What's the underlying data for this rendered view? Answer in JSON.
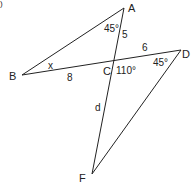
{
  "figure": {
    "corner_mark": ")",
    "points": {
      "A": {
        "label": "A",
        "x": 124,
        "y": 8
      },
      "B": {
        "label": "B",
        "x": 22,
        "y": 75
      },
      "C": {
        "label": "C",
        "x": 115,
        "y": 62
      },
      "D": {
        "label": "D",
        "x": 181,
        "y": 50
      },
      "F": {
        "label": "F",
        "x": 92,
        "y": 174
      }
    },
    "labels": {
      "angle_A": "45°",
      "angle_B": "x",
      "angle_C": "110°",
      "angle_D": "45°",
      "side_AC": "5",
      "side_BC": "8",
      "side_CD": "6",
      "side_CF": "d"
    },
    "line_color": "#222222"
  }
}
